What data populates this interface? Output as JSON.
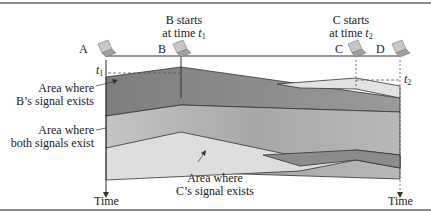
{
  "nodes": [
    {
      "id": "A",
      "label": "A"
    },
    {
      "id": "B",
      "label": "B"
    },
    {
      "id": "C",
      "label": "C"
    },
    {
      "id": "D",
      "label": "D"
    }
  ],
  "events": {
    "b_start": {
      "line1": "B starts",
      "line2_prefix": "at time ",
      "var": "t",
      "sub": "1"
    },
    "c_start": {
      "line1": "C starts",
      "line2_prefix": "at time ",
      "var": "t",
      "sub": "2"
    }
  },
  "time_markers": {
    "t1": {
      "var": "t",
      "sub": "1"
    },
    "t2": {
      "var": "t",
      "sub": "2"
    }
  },
  "annotations": {
    "b_signal": {
      "line1": "Area where",
      "line2": "B’s signal exists"
    },
    "both_signals": {
      "line1": "Area where",
      "line2": "both signals exist"
    },
    "c_signal": {
      "line1": "Area where",
      "line2": "C’s signal exists"
    }
  },
  "axes": {
    "left_time": "Time",
    "right_time": "Time"
  },
  "colors": {
    "b_region": "#8c8c8c",
    "overlap_region": "#b4b4b4",
    "c_region": "#dcdcdc",
    "outline": "#333333",
    "rule": "#8a8a8a"
  }
}
